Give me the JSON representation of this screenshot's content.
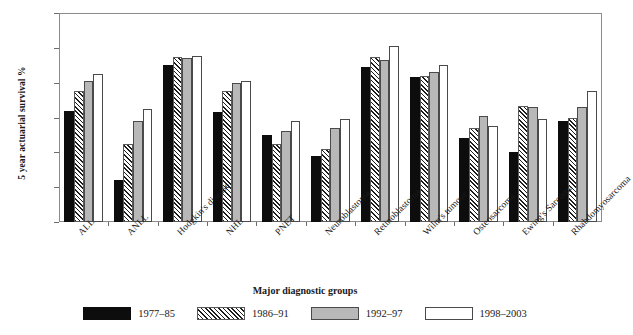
{
  "chart_data": {
    "type": "bar",
    "title": "",
    "xlabel": "Major diagnostic groups",
    "ylabel": "5 year actuarial survival %",
    "ylim": [
      0,
      120
    ],
    "ytick_values": [
      0,
      20,
      40,
      60,
      80,
      100,
      120
    ],
    "ytick_labels": [
      "0",
      "20",
      "40",
      "60",
      "80",
      "100",
      "120"
    ],
    "grid": false,
    "legend_position": "bottom",
    "categories": [
      "ALL",
      "ANLL",
      "Hodgkin's disease",
      "NHL",
      "PNET",
      "Neuroblastoma",
      "Retinoblastoma",
      "Wilm's tumour",
      "Osteosarcoma",
      "Ewing's Sarcoma",
      "Rhabdomyosarcoma"
    ],
    "series": [
      {
        "name": "1977–85",
        "fill": "black",
        "values": [
          63.5,
          24,
          90,
          63,
          50,
          38,
          89,
          83,
          48,
          40,
          58
        ]
      },
      {
        "name": "1986–91",
        "fill": "hatched",
        "values": [
          75,
          45,
          95,
          75,
          45,
          42,
          95,
          84,
          54,
          66.5,
          60
        ]
      },
      {
        "name": "1992–97",
        "fill": "gray",
        "values": [
          81,
          58,
          94,
          80,
          52,
          54,
          93,
          86,
          61,
          66,
          66
        ]
      },
      {
        "name": "1998–2003",
        "fill": "white",
        "values": [
          85,
          65,
          95.5,
          81,
          58,
          59,
          101,
          90,
          55,
          59,
          75
        ]
      }
    ]
  },
  "colors": {
    "series_1977_85": "#0d0d0d",
    "series_1986_91": "#ffffff",
    "series_1992_97": "#b8b8b8",
    "series_1998_2003": "#ffffff",
    "axis": "#8b8b8b",
    "text": "#1a1a1a",
    "background": "#ffffff"
  }
}
